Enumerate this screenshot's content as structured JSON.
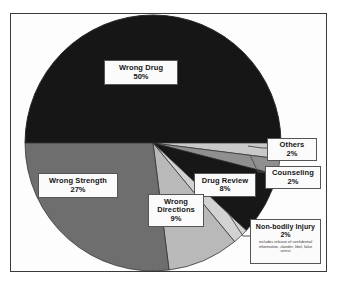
{
  "chart_data": {
    "type": "pie",
    "title": "",
    "subtitle": "",
    "xlabel": "",
    "ylabel": "",
    "legend_position": "in-slice-callouts",
    "grid": false,
    "total_percent": 100,
    "start_angle_deg": 180,
    "direction": "clockwise",
    "categories": [
      "Wrong Drug",
      "Others",
      "Counseling",
      "Drug Review",
      "Non-bodily Injury",
      "Wrong Directions",
      "Wrong Strength"
    ],
    "values": [
      50,
      2,
      2,
      8,
      2,
      9,
      27
    ],
    "slices": [
      {
        "label": "Wrong Drug",
        "percent_text": "50%",
        "value": 50,
        "color": "#161616",
        "callout": false,
        "note": ""
      },
      {
        "label": "Others",
        "percent_text": "2%",
        "value": 2,
        "color": "#c9c9c9",
        "callout": true,
        "note": ""
      },
      {
        "label": "Counseling",
        "percent_text": "2%",
        "value": 2,
        "color": "#8f8f8f",
        "callout": true,
        "note": ""
      },
      {
        "label": "Drug Review",
        "percent_text": "8%",
        "value": 8,
        "color": "#171717",
        "callout": false,
        "note": ""
      },
      {
        "label": "Non-bodily Injury",
        "percent_text": "2%",
        "value": 2,
        "color": "#d2d2d2",
        "callout": true,
        "note": "includes release of confidential information, slander, libel, false arrest"
      },
      {
        "label": "Wrong Directions",
        "percent_text": "9%",
        "value": 9,
        "color": "#b9b9b9",
        "callout": false,
        "note": ""
      },
      {
        "label": "Wrong Strength",
        "percent_text": "27%",
        "value": 27,
        "color": "#6e6e6e",
        "callout": false,
        "note": ""
      }
    ]
  },
  "figure": {
    "frame_color": "#3a3a3a",
    "background_color": "#fdfdfd",
    "pie_outline_color": "#2a2a2a",
    "leader_line_color": "#555555"
  }
}
